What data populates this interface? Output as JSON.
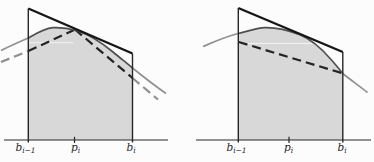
{
  "diagram": {
    "width": 374,
    "height": 162,
    "colors": {
      "background": "#fcfcfc",
      "region_fill": "#d8d8d8",
      "structure_line": "#262626",
      "tangent_line": "#161616",
      "curve_inside": "#4f4f4f",
      "curve_outside": "#919191",
      "dash_inside": "#242424",
      "dash_outside": "#8f8f8f",
      "white_artifact": "#f3f3f3",
      "label_color": "#262626"
    },
    "stroke_widths": {
      "axis": 1.2,
      "vertical": 1.4,
      "tangent": 2.4,
      "curve": 1.7,
      "dash": 2.2,
      "tick": 1.2
    },
    "dash_pattern": "9 5",
    "label_font_size": 10.5,
    "subscript_font_size": 7.5,
    "panels": [
      {
        "id": "left-panel",
        "axis": {
          "x1": 4,
          "x2": 168,
          "y": 140
        },
        "verticals": [
          {
            "id": "left-boundary",
            "x": 28.3,
            "y1": 8.5,
            "y2": 142.5
          },
          {
            "id": "right-boundary",
            "x": 132.5,
            "y1": 53.5,
            "y2": 142.5
          }
        ],
        "tangent_line": {
          "x1": 28.3,
          "y1": 8.5,
          "x2": 132.5,
          "y2": 53.5
        },
        "region_fill": "M 28.3,140 L 28.3,38 C 36,33.5 44,28.4 53,27.6 C 63,27.2 70,28.6 77,30.8 C 90,34.8 102,43 113,52 C 120,58 127,63.2 132.5,68 L 132.5,140 Z",
        "curve_segments": [
          {
            "d": "M 1,50.5 C 10,46 19,42 28.3,38",
            "zone": "outside"
          },
          {
            "d": "M 28.3,38 C 36,33.5 44,28.4 53,27.6 C 63,27.2 70,28.6 77,30.8 C 90,34.8 102,43 113,52 C 120,58 127,63.2 132.5,68",
            "zone": "inside"
          },
          {
            "d": "M 132.5,68 C 143,76.5 156,86.5 166,93.5",
            "zone": "outside"
          }
        ],
        "dashed_segments": [
          {
            "x1": 1,
            "y1": 62,
            "x2": 28.3,
            "y2": 51,
            "zone": "outside"
          },
          {
            "x1": 28.3,
            "y1": 51,
            "x2": 75,
            "y2": 29.5,
            "zone": "inside"
          },
          {
            "x1": 75,
            "y1": 29.5,
            "x2": 132.5,
            "y2": 78,
            "zone": "inside"
          },
          {
            "x1": 132.5,
            "y1": 78,
            "x2": 158,
            "y2": 99.5,
            "zone": "outside"
          }
        ],
        "white_line": {
          "x1": 29.5,
          "y1": 42.7,
          "x2": 73.5,
          "y2": 42.7
        },
        "tick": {
          "x": 74.5,
          "y1": 136.8,
          "y2": 143
        },
        "labels": [
          {
            "id": "label-b-i-minus-1",
            "base": "b",
            "sub": "i−1",
            "x": 25.5,
            "y": 150.5
          },
          {
            "id": "label-p-i",
            "base": "p",
            "sub": "i",
            "x": 75.5,
            "y": 150.5
          },
          {
            "id": "label-b-i",
            "base": "b",
            "sub": "i",
            "x": 131,
            "y": 150.5
          }
        ]
      },
      {
        "id": "right-panel",
        "axis": {
          "x1": 196,
          "x2": 371,
          "y": 140
        },
        "verticals": [
          {
            "id": "left-boundary",
            "x": 238.3,
            "y1": 8,
            "y2": 142.5
          },
          {
            "id": "right-boundary",
            "x": 342.8,
            "y1": 52,
            "y2": 142.5
          }
        ],
        "tangent_line": {
          "x1": 238.3,
          "y1": 8,
          "x2": 342.8,
          "y2": 52
        },
        "region_fill": "M 238.3,140 L 238.3,33.5 C 247,31.5 256,28 265,27.7 C 276,27.4 287,29.8 300,34.8 C 312,39.8 322,49 331,59.5 C 335.5,64.5 339,68.8 342.8,73.5 L 342.8,140 Z",
        "curve_segments": [
          {
            "d": "M 203,46.5 C 215,41.5 227,36 238.3,33.5",
            "zone": "outside"
          },
          {
            "d": "M 238.3,33.5 C 247,31.5 256,28 265,27.7 C 276,27.4 287,29.8 300,34.8 C 312,39.8 322,49 331,59.5 C 335.5,64.5 339,68.8 342.8,73.5",
            "zone": "inside"
          },
          {
            "d": "M 342.8,73.5 C 350,79.5 360,86.5 367.5,92.5",
            "zone": "outside"
          }
        ],
        "dashed_segments": [
          {
            "x1": 238.8,
            "y1": 42,
            "x2": 341.5,
            "y2": 73,
            "zone": "inside"
          }
        ],
        "white_line": {
          "x1": 242,
          "y1": 43.5,
          "x2": 312,
          "y2": 43.5
        },
        "tick": {
          "x": 289,
          "y1": 136.8,
          "y2": 143
        },
        "labels": [
          {
            "id": "label-b-i-minus-1",
            "base": "b",
            "sub": "i−1",
            "x": 236.5,
            "y": 150.5
          },
          {
            "id": "label-p-i",
            "base": "p",
            "sub": "i",
            "x": 288.5,
            "y": 150.5
          },
          {
            "id": "label-b-i",
            "base": "b",
            "sub": "i",
            "x": 342,
            "y": 150.5
          }
        ]
      }
    ]
  }
}
